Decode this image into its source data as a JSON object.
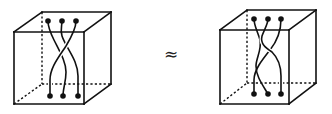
{
  "figure": {
    "relation_symbol": "≈",
    "colors": {
      "ink": "#111111",
      "background": "#ffffff"
    }
  },
  "cubes": [
    {
      "name": "left-cube",
      "front": {
        "tl": [
          14,
          32
        ],
        "tr": [
          84,
          32
        ],
        "br": [
          84,
          104
        ],
        "bl": [
          14,
          104
        ]
      },
      "back": {
        "tl": [
          42,
          12
        ],
        "tr": [
          111,
          12
        ],
        "br": [
          111,
          84
        ],
        "bl": [
          42,
          84
        ]
      },
      "top_points": [
        [
          48,
          21
        ],
        [
          62,
          21
        ],
        [
          76,
          21
        ]
      ],
      "bottom_points": [
        [
          50,
          96
        ],
        [
          63,
          96
        ],
        [
          78,
          96
        ]
      ],
      "strands": [
        {
          "over": false,
          "d": "M48,21 C48,26 50,32 54,40 C60,52 66,62 66,72 C66,82 63,88 63,96"
        },
        {
          "over": false,
          "d": "M62,21 C62,26 60,30 62,36 C66,48 78,60 78,76 C78,86 78,92 78,96"
        },
        {
          "over": true,
          "d": "M76,21 C76,28 72,36 66,46 C58,58 50,68 50,80 C50,88 50,92 50,96"
        }
      ]
    },
    {
      "name": "right-cube",
      "front": {
        "tl": [
          220,
          30
        ],
        "tr": [
          289,
          30
        ],
        "br": [
          289,
          104
        ],
        "bl": [
          220,
          104
        ]
      },
      "back": {
        "tl": [
          247,
          10
        ],
        "tr": [
          316,
          10
        ],
        "br": [
          316,
          83
        ],
        "bl": [
          247,
          83
        ]
      },
      "top_points": [
        [
          254,
          19
        ],
        [
          268,
          19
        ],
        [
          281,
          19
        ]
      ],
      "bottom_points": [
        [
          254,
          94
        ],
        [
          268,
          94
        ],
        [
          281,
          94
        ]
      ],
      "strands": [
        {
          "over": false,
          "d": "M254,19 C254,26 258,32 260,40 C262,50 256,58 256,66 C256,76 262,84 268,94"
        },
        {
          "over": true,
          "d": "M268,19 C268,24 264,30 262,36 C260,44 266,48 272,52 C278,58 281,66 281,76 C281,86 281,90 281,94"
        },
        {
          "over": false,
          "d": "M281,19 C281,28 278,40 270,50 C262,60 254,70 254,80 C254,86 254,90 254,94"
        }
      ]
    }
  ]
}
